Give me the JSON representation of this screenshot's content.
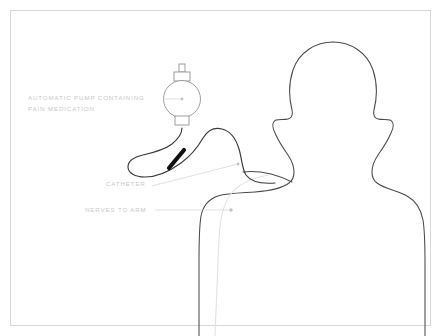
{
  "diagram": {
    "background_color": "#ffffff",
    "frame": {
      "name": "border-frame",
      "color": "#d8d8d8",
      "inset_px": 10
    },
    "colors": {
      "body_outline": "#4a4a4a",
      "catheter": "#3a3a3a",
      "needle": "#111111",
      "nerve": "#e2e2e2",
      "label_text": "#c9c9c9",
      "leader_line": "#d2d2d2",
      "pump_stroke": "#8d8d8d"
    },
    "labels": [
      {
        "id": "pump",
        "name": "label-automatic-pump",
        "line1": "AUTOMATIC PUMP CONTAINING",
        "line2": "PAIN MEDICATION",
        "x": 28,
        "y1": 100,
        "y2": 111,
        "leader_from_x": 163,
        "leader_to_x": 182,
        "leader_y": 99
      },
      {
        "id": "catheter",
        "name": "label-catheter",
        "line1": "CATHETER",
        "line2": "",
        "x": 106,
        "y1": 186,
        "y2": 186,
        "leader_from_x": 152,
        "leader_to_x": 238,
        "leader_y": 183
      },
      {
        "id": "nerves",
        "name": "label-nerves-to-arm",
        "line1": "NERVES TO ARM",
        "line2": "",
        "x": 85,
        "y1": 212,
        "y2": 212,
        "leader_from_x": 155,
        "leader_to_x": 231,
        "leader_y": 210
      }
    ],
    "parts": [
      {
        "name": "human-body-silhouette",
        "description": "head, neck, shoulders and arms outline"
      },
      {
        "name": "pump-device",
        "description": "circular automatic medication pump with top cap and bottom connector"
      },
      {
        "name": "catheter-tubing",
        "description": "flexible tube from pump looping to insertion site at shoulder"
      },
      {
        "name": "needle-insertion",
        "description": "thick dark needle hub segment on catheter"
      },
      {
        "name": "nerve-pathway",
        "description": "faint line tracing nerves running down the arm"
      }
    ]
  }
}
